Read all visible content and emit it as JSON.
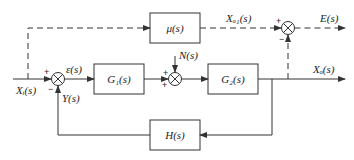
{
  "diagram": {
    "type": "control-system-block-diagram",
    "blocks": {
      "mu": "μ(s)",
      "g1": "G₁(s)",
      "g2": "G₂(s)",
      "h": "H(s)"
    },
    "signals": {
      "input": "Xᵢ(s)",
      "error": "ε(s)",
      "feedback": "Y(s)",
      "disturbance": "N(s)",
      "output": "Xₒ(s)",
      "desired_output": "Xₒ₁(s)",
      "output_error": "E(s)"
    },
    "summing_junctions": {
      "s1": {
        "top_sign": "+",
        "bottom_sign": "−"
      },
      "s2": {
        "top_sign": "+",
        "bottom_sign": "+"
      },
      "s3": {
        "left_sign": "+",
        "bottom_sign": "−"
      }
    },
    "colors": {
      "line": "#333333",
      "background": "#ffffff"
    }
  }
}
